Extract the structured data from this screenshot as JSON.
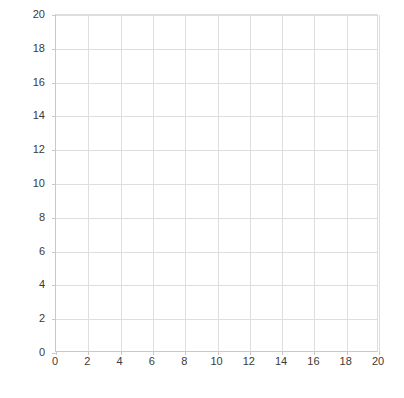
{
  "chart_data": {
    "type": "line",
    "title": "",
    "xlabel": "",
    "ylabel": "",
    "xlim": [
      0,
      20
    ],
    "ylim": [
      0,
      20
    ],
    "xticks": [
      0,
      2,
      4,
      6,
      8,
      10,
      12,
      14,
      16,
      18,
      20
    ],
    "yticks": [
      0,
      2,
      4,
      6,
      8,
      10,
      12,
      14,
      16,
      18,
      20
    ],
    "xticklabels": [
      "0",
      "2",
      "4",
      "6",
      "8",
      "10",
      "12",
      "14",
      "16",
      "18",
      "20"
    ],
    "yticklabels": [
      "0",
      "2",
      "4",
      "6",
      "8",
      "10",
      "12",
      "14",
      "16",
      "18",
      "20"
    ],
    "grid": true,
    "legend": false,
    "series": [],
    "values": [],
    "categories": [],
    "annotations": [],
    "colors": {
      "background": "#ffffff",
      "gridline": "#dedede",
      "axis": "#c9c9c9",
      "tick_label": "#3a3a3a"
    }
  }
}
